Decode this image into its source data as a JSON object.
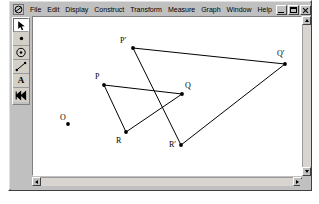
{
  "window": {
    "app_icon": "sketchpad-icon",
    "menus": [
      {
        "label": "File",
        "name": "menu-file"
      },
      {
        "label": "Edit",
        "name": "menu-edit"
      },
      {
        "label": "Display",
        "name": "menu-display"
      },
      {
        "label": "Construct",
        "name": "menu-construct"
      },
      {
        "label": "Transform",
        "name": "menu-transform"
      },
      {
        "label": "Measure",
        "name": "menu-measure"
      },
      {
        "label": "Graph",
        "name": "menu-graph"
      },
      {
        "label": "Window",
        "name": "menu-window"
      },
      {
        "label": "Help",
        "name": "menu-help"
      }
    ],
    "buttons": {
      "minimize": "Minimize",
      "restore": "Restore",
      "close": "Close"
    }
  },
  "toolbox": {
    "tools": [
      {
        "name": "selection-arrow-tool",
        "icon": "arrow-icon",
        "selected": true
      },
      {
        "name": "point-tool",
        "icon": "point-icon",
        "selected": false
      },
      {
        "name": "compass-tool",
        "icon": "circle-icon",
        "selected": false
      },
      {
        "name": "straightedge-tool",
        "icon": "segment-icon",
        "selected": false
      },
      {
        "name": "text-tool",
        "icon": "text-a-icon",
        "selected": false,
        "glyph": "A"
      },
      {
        "name": "custom-tool",
        "icon": "double-arrow-icon",
        "selected": false,
        "glyph": "»"
      }
    ]
  },
  "scrollbars": {
    "vertical": {
      "up": "▲",
      "down": "▼"
    },
    "horizontal": {
      "left": "◄",
      "right": "►"
    }
  },
  "sketch": {
    "stroke_color": "#000000",
    "point_color": "#000000",
    "labels": [
      {
        "text": "P",
        "name": "label-p",
        "x": 84,
        "y": 71
      },
      {
        "text": "Q",
        "name": "label-q",
        "x": 174,
        "y": 80
      },
      {
        "text": "R",
        "name": "label-r",
        "x": 105,
        "y": 135
      },
      {
        "text": "P′",
        "name": "label-p-prime",
        "x": 109,
        "y": 35
      },
      {
        "text": "Q′",
        "name": "label-q-prime",
        "x": 266,
        "y": 48
      },
      {
        "text": "R′",
        "name": "label-r-prime",
        "x": 158,
        "y": 139
      },
      {
        "text": "O",
        "name": "label-o",
        "x": 49,
        "y": 112
      }
    ],
    "points": [
      {
        "name": "point-p",
        "label": "P",
        "x": 93,
        "y": 83
      },
      {
        "name": "point-q",
        "label": "Q",
        "x": 171,
        "y": 92
      },
      {
        "name": "point-r",
        "label": "R",
        "x": 115,
        "y": 130
      },
      {
        "name": "point-p-prime",
        "label": "P′",
        "x": 122,
        "y": 46
      },
      {
        "name": "point-q-prime",
        "label": "Q′",
        "x": 274,
        "y": 62
      },
      {
        "name": "point-r-prime",
        "label": "R′",
        "x": 170,
        "y": 143
      },
      {
        "name": "point-o",
        "label": "O",
        "x": 57,
        "y": 122
      }
    ],
    "segments": [
      {
        "name": "segment-pq",
        "from": "P",
        "to": "Q"
      },
      {
        "name": "segment-qr",
        "from": "Q",
        "to": "R"
      },
      {
        "name": "segment-rp",
        "from": "R",
        "to": "P"
      },
      {
        "name": "segment-p-prime-q-prime",
        "from": "P′",
        "to": "Q′"
      },
      {
        "name": "segment-q-prime-r-prime",
        "from": "Q′",
        "to": "R′"
      },
      {
        "name": "segment-r-prime-p-prime",
        "from": "R′",
        "to": "P′"
      }
    ]
  }
}
